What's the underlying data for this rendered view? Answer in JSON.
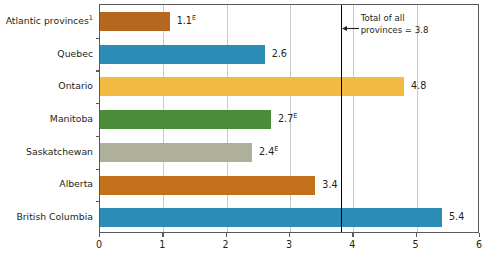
{
  "chart_data": {
    "type": "bar",
    "orientation": "horizontal",
    "title": "",
    "xlabel": "",
    "ylabel": "",
    "xlim": [
      0,
      6
    ],
    "xticks": [
      "0",
      "1",
      "2",
      "3",
      "4",
      "5",
      "6"
    ],
    "grid": true,
    "legend": "none",
    "categories": [
      "Atlantic provinces",
      "Quebec",
      "Ontario",
      "Manitoba",
      "Saskatchewan",
      "Alberta",
      "British Columbia"
    ],
    "values": [
      1.1,
      2.6,
      4.8,
      2.7,
      2.4,
      3.4,
      5.4
    ],
    "bars": [
      {
        "category": "Atlantic provinces",
        "category_footnote": "1",
        "value": 1.1,
        "value_label": "1.1",
        "value_suffix": "E",
        "color": "#b5661f"
      },
      {
        "category": "Quebec",
        "category_footnote": "",
        "value": 2.6,
        "value_label": "2.6",
        "value_suffix": "",
        "color": "#2b8cb5"
      },
      {
        "category": "Ontario",
        "category_footnote": "",
        "value": 4.8,
        "value_label": "4.8",
        "value_suffix": "",
        "color": "#f2bc42"
      },
      {
        "category": "Manitoba",
        "category_footnote": "",
        "value": 2.7,
        "value_label": "2.7",
        "value_suffix": "E",
        "color": "#4a8c3a"
      },
      {
        "category": "Saskatchewan",
        "category_footnote": "",
        "value": 2.4,
        "value_label": "2.4",
        "value_suffix": "E",
        "color": "#aeb099"
      },
      {
        "category": "Alberta",
        "category_footnote": "",
        "value": 3.4,
        "value_label": "3.4",
        "value_suffix": "",
        "color": "#c4711c"
      },
      {
        "category": "British Columbia",
        "category_footnote": "",
        "value": 5.4,
        "value_label": "5.4",
        "value_suffix": "",
        "color": "#2b8cb5"
      }
    ],
    "annotations": [
      {
        "name": "total-reference-line",
        "value": 3.8,
        "line_1": "Total of all",
        "line_2": "provinces = 3.8",
        "color": "#000000"
      }
    ]
  }
}
